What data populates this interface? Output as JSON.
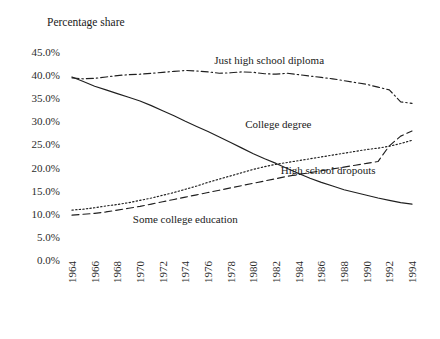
{
  "chart_data": {
    "type": "line",
    "title": "Percentage share",
    "xlabel": "",
    "ylabel": "",
    "ylim": [
      0,
      45
    ],
    "ytick_values": [
      0,
      5,
      10,
      15,
      20,
      25,
      30,
      35,
      40,
      45
    ],
    "ytick_labels": [
      "0.0%",
      "5.0%",
      "10.0%",
      "15.0%",
      "20.0%",
      "25.0%",
      "30.0%",
      "35.0%",
      "40.0%",
      "45.0%"
    ],
    "xlim": [
      1964,
      1994
    ],
    "xtick_values": [
      1964,
      1966,
      1968,
      1970,
      1972,
      1974,
      1976,
      1978,
      1980,
      1982,
      1984,
      1986,
      1988,
      1990,
      1992,
      1994
    ],
    "xtick_labels": [
      "1964",
      "1966",
      "1968",
      "1970",
      "1972",
      "1974",
      "1976",
      "1978",
      "1980",
      "1982",
      "1984",
      "1986",
      "1988",
      "1990",
      "1992",
      "1994"
    ],
    "grid": false,
    "legend_position": "inline-annotations",
    "x": [
      1964,
      1965,
      1966,
      1967,
      1968,
      1969,
      1970,
      1971,
      1972,
      1973,
      1974,
      1975,
      1976,
      1977,
      1978,
      1979,
      1980,
      1981,
      1982,
      1983,
      1984,
      1985,
      1986,
      1987,
      1988,
      1989,
      1990,
      1991,
      1992,
      1993,
      1994
    ],
    "series": [
      {
        "name": "Just high school diploma",
        "dash": "dashdot",
        "label_x": 1981.4,
        "label_y": 42.4,
        "values": [
          39.4,
          39.2,
          39.3,
          39.6,
          39.9,
          40.1,
          40.2,
          40.4,
          40.6,
          40.8,
          41.0,
          40.9,
          40.7,
          40.4,
          40.5,
          40.7,
          40.6,
          40.3,
          40.2,
          40.4,
          40.1,
          39.8,
          39.5,
          39.2,
          38.8,
          38.4,
          38.0,
          37.4,
          36.8,
          34.2,
          33.9
        ]
      },
      {
        "name": "College degree",
        "dash": "dotted",
        "label_x": 1982.2,
        "label_y": 28.6,
        "values": [
          10.8,
          11.0,
          11.3,
          11.7,
          12.0,
          12.4,
          12.9,
          13.4,
          14.0,
          14.6,
          15.3,
          16.0,
          16.8,
          17.5,
          18.2,
          18.9,
          19.6,
          20.2,
          20.7,
          21.1,
          21.5,
          21.9,
          22.3,
          22.7,
          23.1,
          23.5,
          23.9,
          24.2,
          24.6,
          25.2,
          25.9
        ]
      },
      {
        "name": "High school dropouts",
        "dash": "dashed",
        "label_x": 1986.6,
        "label_y": 18.6,
        "values": [
          9.7,
          9.9,
          10.1,
          10.4,
          10.8,
          11.2,
          11.6,
          12.1,
          12.6,
          13.1,
          13.6,
          14.1,
          14.6,
          15.1,
          15.6,
          16.1,
          16.6,
          17.1,
          17.6,
          18.1,
          18.5,
          18.9,
          19.3,
          19.7,
          20.1,
          20.5,
          20.9,
          21.3,
          24.7,
          26.8,
          27.9
        ]
      },
      {
        "name": "Some college education",
        "dash": "solid",
        "label_x": 1974.0,
        "label_y": 8.1,
        "values": [
          39.6,
          38.6,
          37.6,
          36.8,
          36.0,
          35.2,
          34.4,
          33.4,
          32.3,
          31.2,
          30.0,
          28.9,
          27.8,
          26.6,
          25.4,
          24.2,
          23.0,
          21.9,
          20.9,
          19.8,
          18.7,
          17.7,
          16.8,
          16.0,
          15.2,
          14.6,
          14.0,
          13.4,
          12.9,
          12.4,
          12.1
        ]
      }
    ]
  }
}
